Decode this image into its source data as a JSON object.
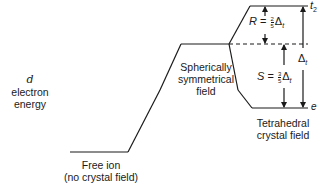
{
  "axis_label": {
    "symbol": "d",
    "line1": "electron",
    "line2": "energy"
  },
  "levels": {
    "free_ion": {
      "line1": "Free ion",
      "line2": "(no crystal field)"
    },
    "spherical": {
      "line1": "Spherically",
      "line2": "symmetrical",
      "line3": "field"
    },
    "tetrahedral": {
      "line1": "Tetrahedral",
      "line2": "crystal field"
    }
  },
  "orbital_sets": {
    "upper": {
      "name": "t",
      "subscript": "2"
    },
    "lower": {
      "name": "e"
    }
  },
  "splittings": {
    "R": {
      "var": "R",
      "eq": "=",
      "num": "2",
      "den": "5",
      "delta": "Δ",
      "delta_sub": "t"
    },
    "S": {
      "var": "S",
      "eq": "=",
      "num": "3",
      "den": "5",
      "delta": "Δ",
      "delta_sub": "t"
    },
    "total": {
      "delta": "Δ",
      "delta_sub": "t"
    }
  },
  "colors": {
    "ink": "#1a1a1a",
    "background": "#ffffff"
  }
}
